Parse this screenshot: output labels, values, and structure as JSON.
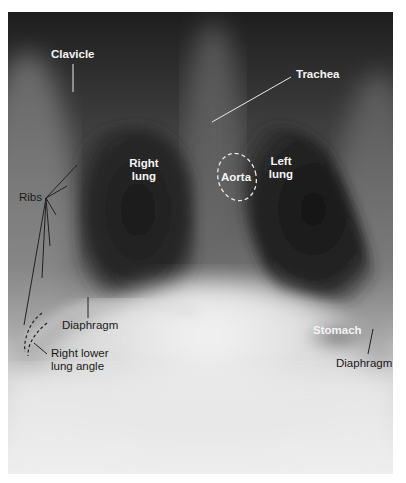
{
  "figure": {
    "labels": {
      "clavicle": "Clavicle",
      "trachea": "Trachea",
      "right_lung_1": "Right",
      "right_lung_2": "lung",
      "left_lung_1": "Left",
      "left_lung_2": "lung",
      "aorta": "Aorta",
      "ribs": "Ribs",
      "diaphragm_right": "Diaphragm",
      "right_lower_lung_angle_1": "Right lower",
      "right_lower_lung_angle_2": "lung angle",
      "stomach": "Stomach",
      "diaphragm_left": "Diaphragm"
    },
    "colors": {
      "background": "#ffffff",
      "film_dark": "#1c1c1c",
      "film_light": "#ececec",
      "label_light": "#f4f4f4",
      "label_dark": "#1a1a1a",
      "leader_light": "#e8e8e8",
      "leader_dark": "#222222"
    }
  }
}
